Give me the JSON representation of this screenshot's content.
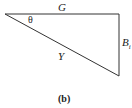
{
  "labels": {
    "top_side": "G",
    "angle": "θ",
    "hypotenuse": "Y",
    "right_side": "B",
    "right_side_sub": "i"
  },
  "caption": "(b)",
  "colors": {
    "line": "#333333",
    "text": "#222222"
  }
}
